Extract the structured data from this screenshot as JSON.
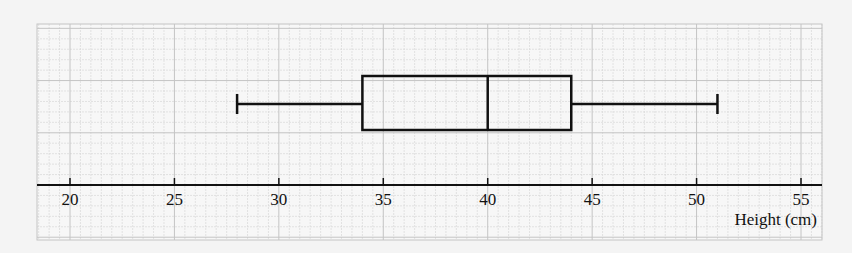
{
  "chart_data": {
    "type": "boxplot",
    "title": "",
    "xlabel": "Height (cm)",
    "ylabel": "",
    "xlim": [
      18.4,
      56.1
    ],
    "x_ticks": [
      20,
      25,
      30,
      35,
      40,
      45,
      50,
      55
    ],
    "x_tick_labels": [
      "20",
      "25",
      "30",
      "35",
      "40",
      "45",
      "50",
      "55"
    ],
    "grid": true,
    "legend": null,
    "box": {
      "min": 28,
      "q1": 34,
      "median": 40,
      "q3": 44,
      "max": 51
    }
  },
  "colors": {
    "background": "#f4f4f4",
    "paper": "#f7f7f7",
    "grid_minor": "#d9d9d9",
    "grid_major": "#c4c4c4",
    "ink": "#111111"
  }
}
